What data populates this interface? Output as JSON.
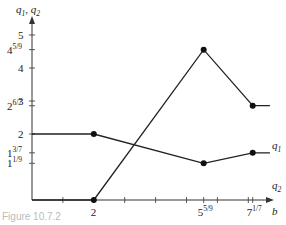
{
  "chart_data": {
    "type": "line",
    "title": "",
    "xlabel": "b",
    "ylabel": "q1, q2",
    "xlim": [
      0,
      7.9
    ],
    "ylim": [
      0,
      5.5
    ],
    "grid": false,
    "legend": "inline labels at right end of each line",
    "x_tick_labels": [
      {
        "value": 2,
        "label": "2",
        "sup": ""
      },
      {
        "value": 5.5556,
        "label": "5",
        "sup": "5/9"
      },
      {
        "value": 7.1429,
        "label": "7",
        "sup": "1/7"
      }
    ],
    "x_minor_ticks": [
      1,
      2,
      3,
      4,
      5,
      5.5556,
      6,
      7,
      7.1429
    ],
    "y_tick_labels": [
      {
        "value": 5,
        "label": "5",
        "sup": ""
      },
      {
        "value": 4.5556,
        "label": "4",
        "sup": "5/9"
      },
      {
        "value": 4,
        "label": "4",
        "sup": ""
      },
      {
        "value": 3,
        "label": "3",
        "sup": ""
      },
      {
        "value": 2.8571,
        "label": "2",
        "sup": "6/7"
      },
      {
        "value": 2,
        "label": "2",
        "sup": ""
      },
      {
        "value": 1.4286,
        "label": "1",
        "sup": "3/7"
      },
      {
        "value": 1.1111,
        "label": "1",
        "sup": "1/9"
      }
    ],
    "series": [
      {
        "name": "q1",
        "x": [
          0,
          2,
          5.5556,
          7.1429,
          7.7
        ],
        "y": [
          0,
          0,
          4.5556,
          2.8571,
          2.8571
        ],
        "markers": [
          2,
          5.5556,
          7.1429
        ]
      },
      {
        "name": "q2",
        "x": [
          0,
          2,
          5.5556,
          7.1429,
          7.7
        ],
        "y": [
          2,
          2,
          1.1111,
          1.4286,
          1.4286
        ],
        "markers": [
          2,
          5.5556,
          7.1429
        ]
      }
    ]
  },
  "labels": {
    "y_axis_q1": "q",
    "y_axis_q1_sub": "1",
    "y_axis_sep": ", ",
    "y_axis_q2": "q",
    "y_axis_q2_sub": "2",
    "x_axis": "b",
    "series_q1": "q",
    "series_q1_sub": "1",
    "series_q2": "q",
    "series_q2_sub": "2",
    "caption": "Figure 10.7.2"
  }
}
